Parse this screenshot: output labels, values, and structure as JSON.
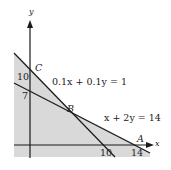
{
  "diagram": {
    "type": "linear-programming-feasible-region",
    "axes": {
      "x_label": "x",
      "y_label": "y"
    },
    "constraints": [
      {
        "equation": "0.1x + 0.1y = 1",
        "x_intercept": 10,
        "y_intercept": 10
      },
      {
        "equation": "x + 2y = 14",
        "x_intercept": 14,
        "y_intercept": 7
      }
    ],
    "vertices": [
      {
        "name": "A",
        "x": 14,
        "y": 0
      },
      {
        "name": "B",
        "x": 6,
        "y": 4
      },
      {
        "name": "C",
        "x": 0,
        "y": 10
      }
    ],
    "tick_labels": {
      "y": [
        "10",
        "7"
      ],
      "x": [
        "10",
        "14"
      ]
    },
    "colors": {
      "shade": "#d9d9d9",
      "line": "#1a1a1a",
      "background": "#ffffff"
    }
  },
  "labels": {
    "y_axis": "y",
    "x_axis": "x",
    "point_a": "A",
    "point_b": "B",
    "point_c": "C",
    "tick_y_10": "10",
    "tick_y_7": "7",
    "tick_x_10": "10",
    "tick_x_14": "14",
    "eq1": "0.1x + 0.1y = 1",
    "eq2": "x + 2y = 14"
  }
}
